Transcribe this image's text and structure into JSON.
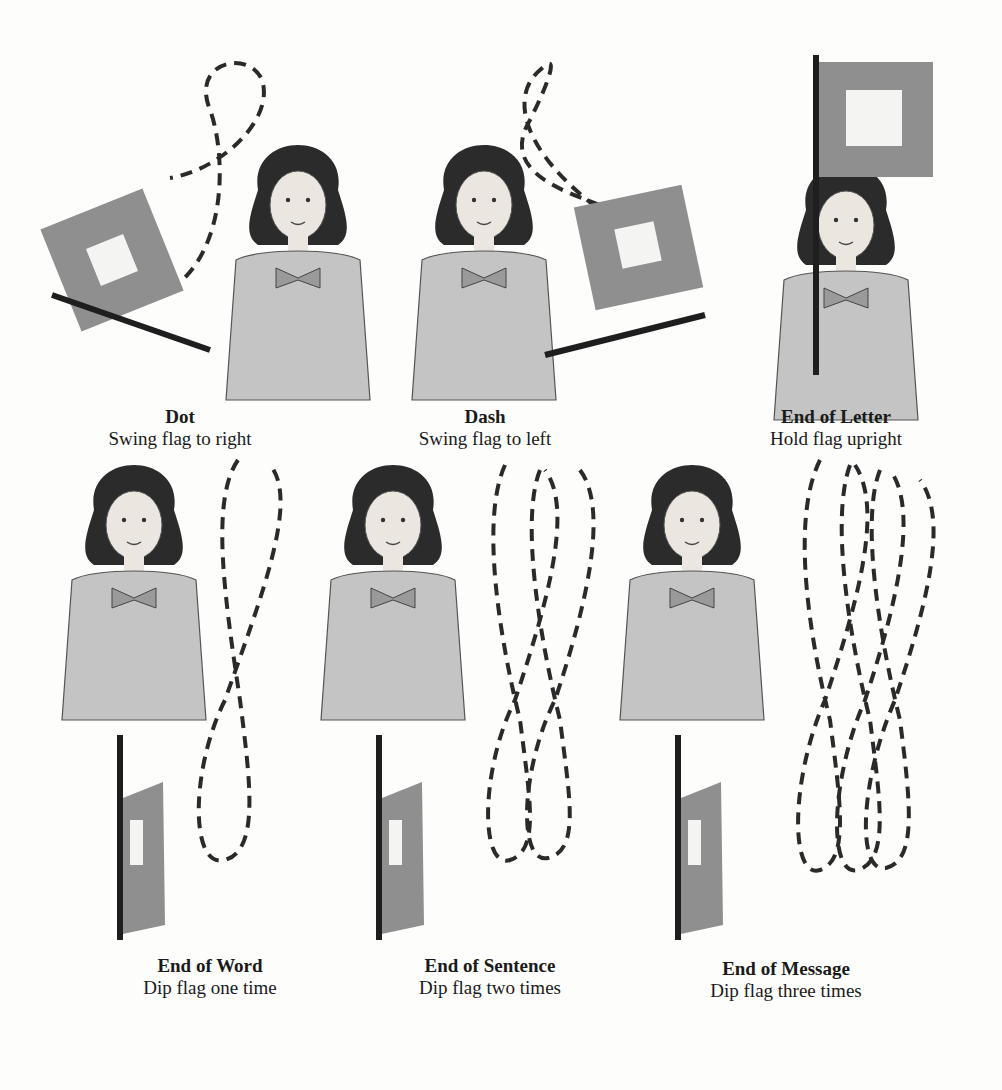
{
  "figure": {
    "colors": {
      "flag": "#8f8f8f",
      "flag_inner": "#f4f4f2",
      "line": "#2a2a2a",
      "skin": "#e9e4df",
      "hair": "#2b2b2b",
      "dress": "#bdbdbd"
    },
    "panels": [
      {
        "title": "Dot",
        "description": "Swing flag to right"
      },
      {
        "title": "Dash",
        "description": "Swing flag to left"
      },
      {
        "title": "End of Letter",
        "description": "Hold flag upright"
      },
      {
        "title": "End of Word",
        "description": "Dip flag one time"
      },
      {
        "title": "End of Sentence",
        "description": "Dip flag two times"
      },
      {
        "title": "End of Message",
        "description": "Dip flag three times"
      }
    ]
  }
}
